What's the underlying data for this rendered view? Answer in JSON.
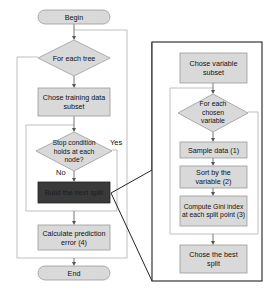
{
  "colors": {
    "box_fill": "#d9d9d9",
    "box_stroke": "#9a9a9a",
    "dark_fill": "#3a3a3a",
    "loop_line": "#b8b8b8",
    "panel_stroke": "#222222",
    "arrow": "#555555"
  },
  "main_flow": {
    "begin": "Begin",
    "for_each_tree": "For each tree",
    "chose_training": "Chose training data subset",
    "stop_condition": "Stop condition holds at each node?",
    "yes_label": "Yes",
    "no_label": "No",
    "build_split": "Build the next split",
    "calculate_error": "Calculate prediction error (4)",
    "end": "End"
  },
  "detail_panel": {
    "chose_variable": "Chose variable subset",
    "for_each_variable": "For each chosen variable",
    "sample_data": "Sample data (1)",
    "sort_variable": "Sort by the variable (2)",
    "compute_gini": "Compute Gini index at each split point (3)",
    "chose_best": "Chose the best split"
  }
}
